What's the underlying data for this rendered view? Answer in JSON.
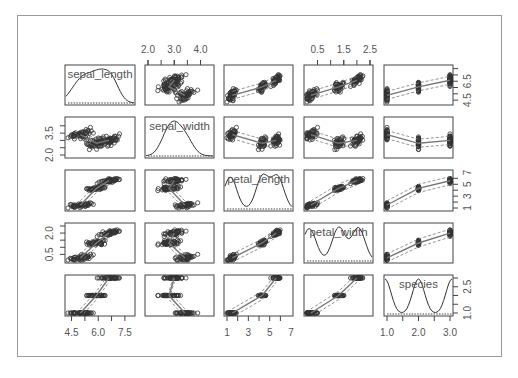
{
  "chart_data": {
    "type": "scatter",
    "title": "",
    "subtitle": "Scatterplot matrix (pairs with loess smoothers and density on diagonal)",
    "variables": [
      "sepal_length",
      "sepal_width",
      "petal_length",
      "petal_width",
      "species"
    ],
    "diagonal": "density",
    "grid": false,
    "legend": null,
    "axes": {
      "top": [
        {
          "column": 1,
          "variable": "sepal_width",
          "ticks": [
            "2.0",
            "3.0",
            "4.0"
          ],
          "range": [
            2.0,
            4.4
          ]
        },
        {
          "column": 3,
          "variable": "petal_width",
          "ticks": [
            "0.5",
            "1.5",
            "2.5"
          ],
          "range": [
            0.1,
            2.5
          ]
        }
      ],
      "bottom": [
        {
          "column": 0,
          "variable": "sepal_length",
          "ticks": [
            "4.5",
            "6.0",
            "7.5"
          ],
          "range": [
            4.3,
            7.9
          ]
        },
        {
          "column": 2,
          "variable": "petal_length",
          "ticks": [
            "1",
            "3",
            "5",
            "7"
          ],
          "range": [
            1.0,
            6.9
          ]
        },
        {
          "column": 4,
          "variable": "species",
          "ticks": [
            "1.0",
            "2.0",
            "3.0"
          ],
          "range": [
            1.0,
            3.0
          ]
        }
      ],
      "left": [
        {
          "row": 1,
          "variable": "sepal_width",
          "ticks": [
            "2.0",
            "3.5"
          ],
          "range": [
            2.0,
            4.4
          ]
        },
        {
          "row": 3,
          "variable": "petal_width",
          "ticks": [
            "0.5",
            "2.0"
          ],
          "range": [
            0.1,
            2.5
          ]
        }
      ],
      "right": [
        {
          "row": 0,
          "variable": "sepal_length",
          "ticks": [
            "4.5",
            "6.5"
          ],
          "range": [
            4.3,
            7.9
          ]
        },
        {
          "row": 2,
          "variable": "petal_length",
          "ticks": [
            "1",
            "3",
            "5",
            "7"
          ],
          "range": [
            1.0,
            6.9
          ]
        },
        {
          "row": 4,
          "variable": "species",
          "ticks": [
            "1.0",
            "2.5"
          ],
          "range": [
            1.0,
            3.0
          ]
        }
      ]
    },
    "species_means": {
      "setosa": {
        "sepal_length": 5.0,
        "sepal_width": 3.4,
        "petal_length": 1.5,
        "petal_width": 0.25,
        "species": 1
      },
      "versicolor": {
        "sepal_length": 5.9,
        "sepal_width": 2.8,
        "petal_length": 4.3,
        "petal_width": 1.3,
        "species": 2
      },
      "virginica": {
        "sepal_length": 6.6,
        "sepal_width": 3.0,
        "petal_length": 5.6,
        "petal_width": 2.0,
        "species": 3
      }
    },
    "n_points": 150
  },
  "colors": {
    "frame": "#9a9a9a",
    "panel_border": "#444444",
    "points": "#333333",
    "smoother": "#777777",
    "text": "#555555"
  }
}
